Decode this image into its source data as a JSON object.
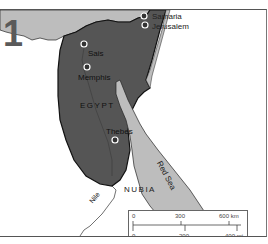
{
  "map": {
    "plate_number": "1",
    "regions": {
      "egypt": "EGYPT",
      "nubia": "NUBIA"
    },
    "water": {
      "red_sea": "Red Sea",
      "nile": "Nile"
    },
    "cities": [
      {
        "name": "Samaria"
      },
      {
        "name": "Jerusalem"
      },
      {
        "name": "Sais"
      },
      {
        "name": "Memphis"
      },
      {
        "name": "Thebes"
      }
    ],
    "scale_bar": {
      "km_labels": [
        "0",
        "300",
        "600 km"
      ],
      "mi_labels": [
        "0",
        "200",
        "400 mi"
      ]
    },
    "colors": {
      "egypt_fill": "#555555",
      "sea_fill": "#bdbdbd",
      "land": "#ffffff",
      "border": "#1a1a1a"
    }
  }
}
